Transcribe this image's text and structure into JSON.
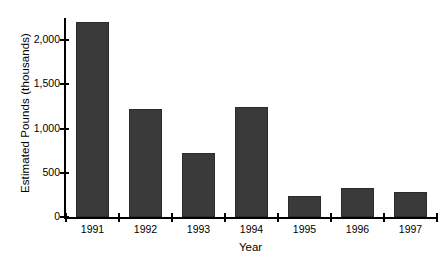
{
  "chart_data": {
    "type": "bar",
    "title": "",
    "subtitle": "",
    "xlabel": "Year",
    "ylabel": "Estimated Pounds (thousands)",
    "categories": [
      "1991",
      "1992",
      "1993",
      "1994",
      "1995",
      "1996",
      "1997"
    ],
    "values": [
      2200,
      1225,
      720,
      1245,
      235,
      325,
      280
    ],
    "series": [
      {
        "name": "Estimated Pounds",
        "values": [
          2200,
          1225,
          720,
          1245,
          235,
          325,
          280
        ]
      }
    ],
    "ylim": [
      0,
      2250
    ],
    "ytick_values": [
      0,
      500,
      1000,
      1500,
      2000
    ],
    "ytick_labels": [
      "0",
      "500",
      "1,000",
      "1,500",
      "2,000"
    ],
    "grid": false,
    "legend": false,
    "legend_position": "none",
    "bar_color": "#3a3a3a",
    "bar_edge_color": "#2b2b2b",
    "axis_color": "#000000",
    "background_color": "#ffffff"
  }
}
